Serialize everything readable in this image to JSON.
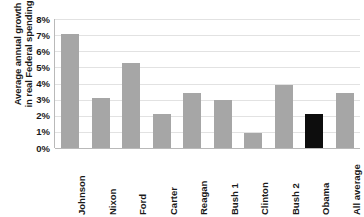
{
  "chart_data": {
    "type": "bar",
    "title": "",
    "xlabel": "",
    "ylabel": "Average annual growth in real Federal spending",
    "ylabel_lines": [
      "Average annual growth",
      "in real Federal spending"
    ],
    "categories": [
      "Johnson",
      "Nixon",
      "Ford",
      "Carter",
      "Reagan",
      "Bush 1",
      "Clinton",
      "Bush 2",
      "Obama",
      "All average"
    ],
    "values": [
      7.1,
      3.1,
      5.3,
      2.1,
      3.4,
      3.0,
      0.95,
      3.9,
      2.1,
      3.4
    ],
    "value_unit": "%",
    "ylim": [
      0,
      8
    ],
    "ytick_values": [
      8,
      7,
      6,
      5,
      4,
      3,
      2,
      1,
      0
    ],
    "ytick_labels": [
      "8%",
      "7%",
      "6%",
      "5%",
      "4%",
      "3%",
      "2%",
      "1%",
      "0%"
    ],
    "grid": true,
    "grid_axis": "y",
    "legend": false,
    "legend_position": "none",
    "bar_colors": [
      "#a6a6a6",
      "#a6a6a6",
      "#a6a6a6",
      "#a6a6a6",
      "#a6a6a6",
      "#a6a6a6",
      "#a6a6a6",
      "#a6a6a6",
      "#0d0d0d",
      "#a6a6a6"
    ],
    "default_bar_color": "#a6a6a6",
    "highlight_bar_color": "#0d0d0d",
    "highlight_category": "Obama",
    "axis_color": "#b9b9b9",
    "gridline_color": "#e2e2e2",
    "text_color": "#1a1a1a",
    "background_color": "#ffffff"
  }
}
